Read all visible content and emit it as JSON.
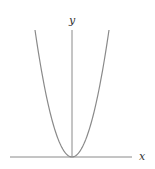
{
  "chart_data": {
    "type": "line",
    "title": "",
    "xlabel": "x",
    "ylabel": "y",
    "function": "y = x^2",
    "series": [
      {
        "name": "parabola",
        "x": [
          -1,
          -0.75,
          -0.5,
          -0.25,
          0,
          0.25,
          0.5,
          0.75,
          1
        ],
        "y": [
          1,
          0.5625,
          0.25,
          0.0625,
          0,
          0.0625,
          0.25,
          0.5625,
          1
        ]
      }
    ],
    "xlim": [
      -1,
      1
    ],
    "ylim": [
      0,
      1
    ],
    "grid": false,
    "ticks": false,
    "line_color": "#888888",
    "axis_color": "#888888"
  },
  "labels": {
    "x": "x",
    "y": "y"
  }
}
